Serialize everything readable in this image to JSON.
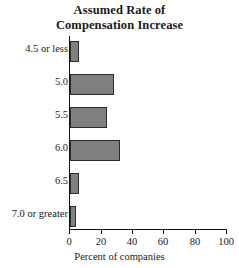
{
  "chart_data": {
    "type": "bar",
    "orientation": "horizontal",
    "title": "Assumed Rate of Compensation Increase",
    "title_lines": [
      "Assumed Rate of",
      "Compensation Increase"
    ],
    "categories": [
      "4.5 or less",
      "5.0",
      "5.5",
      "6.0",
      "6.5",
      "7.0 or greater"
    ],
    "values": [
      6,
      28,
      24,
      32,
      6,
      4
    ],
    "xlabel": "Percent of companies",
    "ylabel": "",
    "xlim": [
      0,
      100
    ],
    "xticks": [
      0,
      20,
      40,
      60,
      80,
      100
    ],
    "xtick_labels": [
      "0",
      "20",
      "40",
      "60",
      "80",
      "100"
    ],
    "grid": false,
    "legend": false,
    "bar_fill_color": "#808080",
    "bar_edge_color": "#2b2b2b",
    "axis_color": "#111111",
    "background_color": "#ffffff"
  }
}
